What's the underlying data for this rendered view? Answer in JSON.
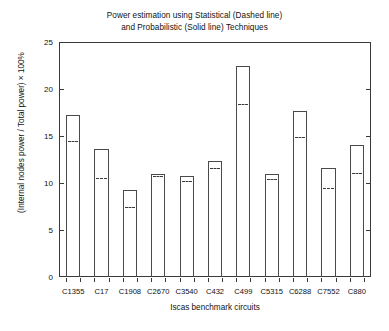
{
  "chart_data": {
    "type": "bar",
    "title": "Power estimation using Statistical (Dashed line) and Probabilistic (Solid line) Techniques",
    "title_lines": [
      "Power estimation using Statistical (Dashed line)",
      "and Probabilistic (Solid line) Techniques"
    ],
    "xlabel": "Iscas benchmark circuits",
    "ylabel": "(Internal nodes power / Total power) × 100%",
    "categories": [
      "C1355",
      "C17",
      "C1908",
      "C2670",
      "C3540",
      "C432",
      "C499",
      "C5315",
      "C6288",
      "C7552",
      "C880"
    ],
    "ylim": [
      0,
      25
    ],
    "yticks": [
      0,
      5,
      10,
      15,
      20,
      25
    ],
    "ytick_labels": [
      "0",
      "5",
      "10",
      "15",
      "20",
      "25"
    ],
    "grid": false,
    "legend": "none",
    "legend_in_title": true,
    "series": [
      {
        "name": "Probabilistic (Solid line)",
        "style": "bar-outline-solid",
        "values": [
          17.2,
          13.6,
          9.3,
          11.0,
          10.7,
          12.3,
          22.5,
          11.0,
          17.7,
          11.6,
          14.0
        ]
      },
      {
        "name": "Statistical (Dashed line)",
        "style": "dashed-marker",
        "values": [
          14.5,
          10.5,
          7.5,
          10.7,
          10.2,
          11.6,
          18.4,
          10.4,
          14.9,
          9.5,
          11.1
        ]
      }
    ]
  },
  "colors": {
    "axis": "#3a3a3a",
    "bar_outline": "#4a4a4a",
    "dash": "#3c3c3c",
    "background": "#ffffff",
    "text": "#111111"
  }
}
